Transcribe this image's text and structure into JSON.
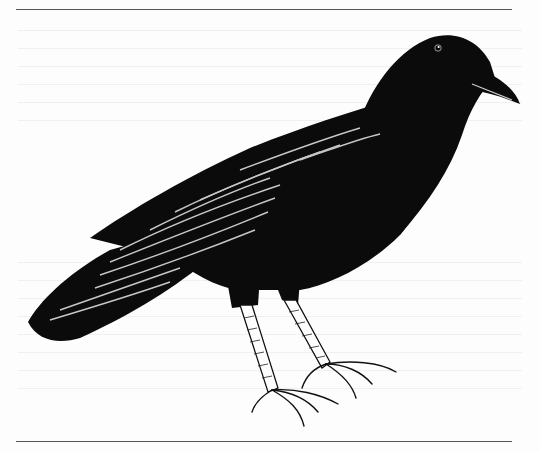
{
  "figure": {
    "style": "pen-and-ink line drawing",
    "facing": "right",
    "colors": {
      "ink": "#0b0b0b",
      "paper": "#fdfdfd",
      "rule": "#555555",
      "highlight": "#e8e8e8"
    }
  }
}
